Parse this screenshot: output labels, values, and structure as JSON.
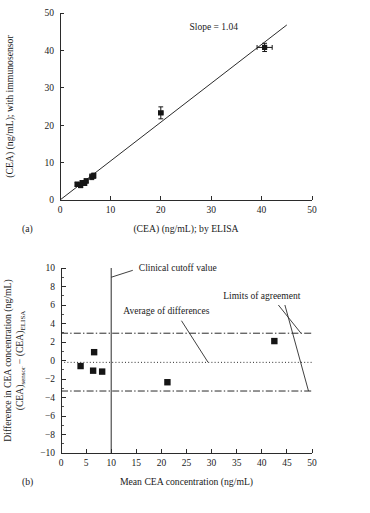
{
  "figure": {
    "panels": [
      {
        "tag": "(a)",
        "tag_name": "panel-a"
      },
      {
        "tag": "(b)",
        "tag_name": "panel-b"
      }
    ]
  },
  "chart_data": [
    {
      "type": "scatter",
      "panel": "(a)",
      "title": "",
      "xlabel": "(CEA) (ng/mL); by ELISA",
      "ylabel": "(CEA) (ng/mL); with immunosensor",
      "xlim": [
        0,
        50
      ],
      "ylim": [
        0,
        50
      ],
      "xticks": [
        0,
        10,
        20,
        30,
        40,
        50
      ],
      "yticks": [
        0,
        10,
        20,
        30,
        40,
        50
      ],
      "xticklabels": [
        "0",
        "10",
        "20",
        "30",
        "40",
        "50"
      ],
      "yticklabels": [
        "0",
        "10",
        "20",
        "30",
        "40",
        "50"
      ],
      "grid": false,
      "legend": "none",
      "annotations": [
        {
          "text": "Slope = 1.04",
          "x": 30.5,
          "y": 45.5
        }
      ],
      "fit_line": {
        "label": "regression line",
        "slope": 1.04,
        "intercept": 0.0,
        "x_start": 0.0,
        "x_end": 45.0
      },
      "points": [
        {
          "x": 3.4,
          "y": 4.2,
          "xerr": 0.35,
          "yerr": 0.55
        },
        {
          "x": 4.1,
          "y": 3.9,
          "xerr": 0.35,
          "yerr": 0.6
        },
        {
          "x": 4.4,
          "y": 4.6,
          "xerr": 0.3,
          "yerr": 0.55
        },
        {
          "x": 4.9,
          "y": 4.5,
          "xerr": 0.3,
          "yerr": 0.6
        },
        {
          "x": 5.2,
          "y": 5.1,
          "xerr": 0.3,
          "yerr": 0.55
        },
        {
          "x": 6.3,
          "y": 6.2,
          "xerr": 0.3,
          "yerr": 0.75
        },
        {
          "x": 6.7,
          "y": 6.5,
          "xerr": 0.3,
          "yerr": 0.7
        },
        {
          "x": 20.0,
          "y": 23.3,
          "xerr": 0.45,
          "yerr": 1.6
        },
        {
          "x": 40.6,
          "y": 40.8,
          "xerr": 1.5,
          "yerr": 1.1
        }
      ]
    },
    {
      "type": "scatter",
      "panel": "(b)",
      "title": "",
      "xlabel": "Mean CEA concentration (ng/mL)",
      "ylabel_line1": "Difference in CEA concentration (ng/mL)",
      "ylabel_line2_prefix": "(CEA)",
      "ylabel_line2_sub1": "sensor",
      "ylabel_line2_mid": " − (CEA)",
      "ylabel_line2_sub2": "ELISA",
      "xlim": [
        0,
        50
      ],
      "ylim": [
        -10,
        10
      ],
      "xticks": [
        0,
        5,
        10,
        15,
        20,
        25,
        30,
        35,
        40,
        45,
        50
      ],
      "yticks": [
        -10,
        -8,
        -6,
        -4,
        -2,
        0,
        2,
        4,
        6,
        8,
        10
      ],
      "xticklabels": [
        "0",
        "5",
        "10",
        "15",
        "20",
        "25",
        "30",
        "35",
        "40",
        "45",
        "50"
      ],
      "yticklabels": [
        "−10",
        "−8",
        "−6",
        "−4",
        "−2",
        "0",
        "2",
        "4",
        "6",
        "8",
        "10"
      ],
      "grid": false,
      "legend": "none",
      "reference_lines": [
        {
          "name": "average-of-differences",
          "label": "Average of differences",
          "value": -0.2,
          "orientation": "horizontal",
          "style": "dotted"
        },
        {
          "name": "upper-limit-of-agreement",
          "label": "Limits of agreement",
          "value": 2.95,
          "orientation": "horizontal",
          "style": "dash-dot"
        },
        {
          "name": "lower-limit-of-agreement",
          "label": "Limits of agreement",
          "value": -3.3,
          "orientation": "horizontal",
          "style": "dash-dot"
        },
        {
          "name": "clinical-cutoff",
          "label": "Clinical cutoff value",
          "value": 10.0,
          "orientation": "vertical",
          "style": "solid"
        }
      ],
      "annotations": [
        {
          "name": "clinical-cutoff-label",
          "text": "Clinical cutoff value",
          "x": 15.5,
          "y": 9.7
        },
        {
          "name": "average-of-differences-label",
          "text": "Average of differences",
          "x": 21.0,
          "y": 5.0
        },
        {
          "name": "limits-of-agreement-label",
          "text": "Limits of agreement",
          "x": 40.0,
          "y": 6.6
        }
      ],
      "points": [
        {
          "x": 3.9,
          "y": -0.6
        },
        {
          "x": 6.6,
          "y": 0.9
        },
        {
          "x": 6.4,
          "y": -1.1
        },
        {
          "x": 8.2,
          "y": -1.2
        },
        {
          "x": 21.2,
          "y": -2.35
        },
        {
          "x": 42.5,
          "y": 2.1
        }
      ]
    }
  ]
}
